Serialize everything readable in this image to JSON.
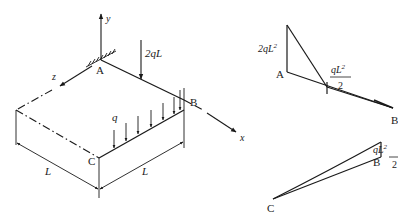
{
  "structure": {
    "points": {
      "A": "A",
      "B": "B",
      "C": "C"
    },
    "axes": {
      "x": "x",
      "y": "y",
      "z": "z"
    },
    "loads": {
      "point_load": "2qL",
      "distributed_load": "q"
    },
    "dimensions": {
      "left": "L",
      "right": "L"
    }
  },
  "moment_diagram_AB": {
    "label_A": "A",
    "label_B": "B",
    "value_A": "2qL",
    "value_A_sup": "2",
    "mid_num": "qL",
    "mid_num_sup": "2",
    "mid_den": "2"
  },
  "moment_diagram_CB": {
    "label_C": "C",
    "label_B": "B",
    "value_num": "qL",
    "value_num_sup": "2",
    "value_den": "2"
  },
  "colors": {
    "ink": "#1a1a1a",
    "background": "#ffffff"
  }
}
